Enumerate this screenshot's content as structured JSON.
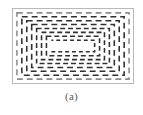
{
  "figure": {
    "caption": "(a)",
    "panel": {
      "border_color": "#b9b9b9",
      "background_color": "#ffffff",
      "x": 12,
      "y": 8,
      "width": 122,
      "height": 76
    }
  },
  "chart_data": {
    "type": "diagram",
    "title": "(a)",
    "subtitle": "",
    "xlabel": "",
    "ylabel": "",
    "legend": [],
    "annotations": [],
    "grid": false,
    "stroke": {
      "color": "#303030",
      "light_color": "#8c8c8c",
      "width": 1.6,
      "dash_pattern": "5 3",
      "dash_pattern_inner": "4 3"
    },
    "viewbox": {
      "x": 0,
      "y": 0,
      "width": 122,
      "height": 76
    },
    "turn_count": 8,
    "turns": [
      {
        "index": 0,
        "x": 4,
        "y": 4,
        "width": 114,
        "height": 68,
        "closed": true,
        "color": "#8c8c8c",
        "dash": "6 4"
      },
      {
        "index": 1,
        "x": 9,
        "y": 8,
        "width": 104,
        "height": 60,
        "closed": true,
        "color": "#303030",
        "dash": "6 4"
      },
      {
        "index": 2,
        "x": 14,
        "y": 12,
        "width": 94,
        "height": 52,
        "closed": true,
        "color": "#303030",
        "dash": "6 4"
      },
      {
        "index": 3,
        "x": 19,
        "y": 16,
        "width": 84,
        "height": 44,
        "closed": true,
        "color": "#303030",
        "dash": "6 4"
      },
      {
        "index": 4,
        "x": 24,
        "y": 20,
        "width": 74,
        "height": 36,
        "closed": true,
        "color": "#303030",
        "dash": "5 3"
      },
      {
        "index": 5,
        "x": 29,
        "y": 24,
        "width": 64,
        "height": 28,
        "closed": true,
        "color": "#303030",
        "dash": "5 3"
      },
      {
        "index": 6,
        "x": 34,
        "y": 28,
        "width": 54,
        "height": 20,
        "closed": true,
        "color": "#303030",
        "dash": "5 3"
      },
      {
        "index": 7,
        "x": 39,
        "y": 32,
        "width": 44,
        "height": 12,
        "closed": false,
        "color": "#303030",
        "dash": "4 3",
        "open_side": "left",
        "path": "M 39 44 L 83 44 L 83 32 L 39 32"
      }
    ]
  }
}
